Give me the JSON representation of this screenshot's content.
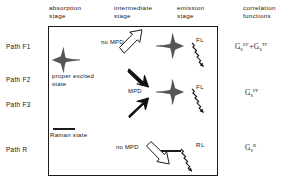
{
  "headers": {
    "absorption": "absorption\nstage",
    "intermediate": "intermediate\nstage",
    "emission": "emission\nstage",
    "correlation": "correlation\nfunctions"
  },
  "paths": [
    {
      "id": "F1",
      "label": "Path F1"
    },
    {
      "id": "F2",
      "label": "Path F2"
    },
    {
      "id": "F3",
      "label": "Path F3"
    },
    {
      "id": "R",
      "label": "Path R"
    }
  ],
  "stage_labels": {
    "proper_excited_state": "proper  excited\nstate",
    "raman_state": "Raman  state"
  },
  "process_labels": {
    "no_mpd_top": "no MPD",
    "mpd": "MPD",
    "no_mpd_bottom": "no MPD"
  },
  "emission_labels": {
    "fl_top": "FL",
    "fl_middle": "FL",
    "rl_bottom": "RL"
  },
  "correlation_functions": [
    {
      "row": "F1",
      "text": "G_S^EF + G_S^TF",
      "terms": [
        {
          "base": "G",
          "sub": "S",
          "sup": "EF"
        },
        {
          "operator": "+"
        },
        {
          "base": "G",
          "sub": "S",
          "sup": "TF"
        }
      ]
    },
    {
      "row": "F2_F3",
      "text": "G_S^PF",
      "terms": [
        {
          "base": "G",
          "sub": "S",
          "sup": "PF"
        }
      ]
    },
    {
      "row": "R",
      "text": "G_S^R",
      "terms": [
        {
          "base": "G",
          "sub": "S",
          "sup": "R"
        }
      ]
    }
  ],
  "glyphs": {
    "absorption_band": "leftward-peaked-spectral-band",
    "emission_band": "rightward-peaked-spectral-band",
    "raman_level": "horizontal-level-bar",
    "hollow_arrow": "outline-diagonal-arrow",
    "solid_arrow": "filled-diagonal-arrow",
    "squiggly_arrow": "zigzag-emission-arrow"
  },
  "colors": {
    "ink": "#141414",
    "frame": "#1a1a1a",
    "fill": "#555555",
    "background": "#ffffff"
  }
}
